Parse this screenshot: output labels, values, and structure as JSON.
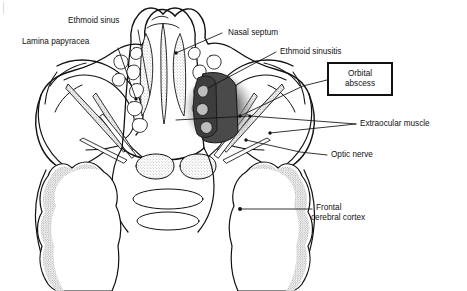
{
  "figure": {
    "type": "anatomical-line-drawing",
    "view": "axial cross-section through orbits and ethmoid sinuses",
    "background_color": "#ffffff",
    "line_color": "#111111",
    "abscess_fill": "#4a4a4a",
    "stipple_color": "#6b6b6b"
  },
  "labels": [
    {
      "id": "ethmoid-sinus",
      "text": "Ethmoid sinus",
      "lines": [
        "Ethmoid sinus"
      ]
    },
    {
      "id": "lamina-papyracea",
      "text": "Lamina papyracea",
      "lines": [
        "Lamina papyracea"
      ]
    },
    {
      "id": "nasal-septum",
      "text": "Nasal septum",
      "lines": [
        "Nasal septum"
      ]
    },
    {
      "id": "ethmoid-sinusitis",
      "text": "Ethmoid sinusitis",
      "lines": [
        "Ethmoid sinusitis"
      ]
    },
    {
      "id": "orbital-abscess",
      "text": "Orbital abscess",
      "lines": [
        "Orbital",
        "abscess"
      ],
      "boxed": true
    },
    {
      "id": "extraocular-muscle",
      "text": "Extraocular muscle",
      "lines": [
        "Extraocular muscle"
      ]
    },
    {
      "id": "optic-nerve",
      "text": "Optic nerve",
      "lines": [
        "Optic nerve"
      ]
    },
    {
      "id": "frontal-cerebral-cortex",
      "text": "Frontal cerebral cortex",
      "lines": [
        "Frontal",
        "cerebral cortex"
      ]
    }
  ],
  "label_text": {
    "ethmoid_sinus": "Ethmoid sinus",
    "lamina_papyracea": "Lamina papyracea",
    "nasal_septum": "Nasal septum",
    "ethmoid_sinusitis": "Ethmoid sinusitis",
    "orbital_abscess_line1": "Orbital",
    "orbital_abscess_line2": "abscess",
    "extraocular_muscle": "Extraocular muscle",
    "optic_nerve": "Optic nerve",
    "frontal_cortex_line1": "Frontal",
    "frontal_cortex_line2": "cerebral cortex"
  }
}
